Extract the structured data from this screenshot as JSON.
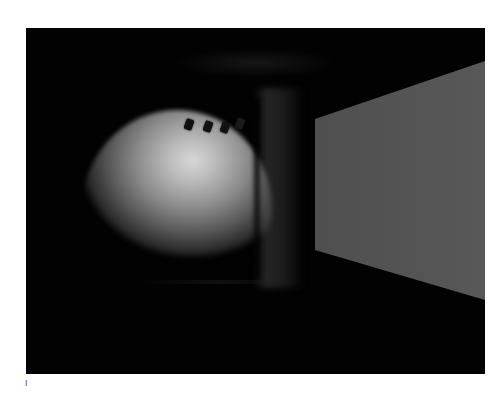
{
  "figure": {
    "label": "I",
    "background_color": "#020202",
    "scene": {
      "description": "Rendered interior lighting scene",
      "fixtures": [
        {
          "name": "track-light-1",
          "x": 162,
          "y": 92
        },
        {
          "name": "track-light-2",
          "x": 181,
          "y": 94
        },
        {
          "name": "track-light-3",
          "x": 198,
          "y": 95
        },
        {
          "name": "track-light-4",
          "x": 212,
          "y": 91
        }
      ],
      "panel_color": "#555555",
      "wash_peak_color": "#d8d8d8"
    }
  }
}
